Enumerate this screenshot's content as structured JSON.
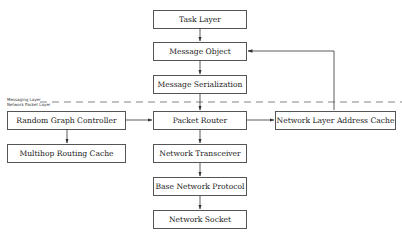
{
  "diagram": {
    "layers": {
      "upper_label": "Messaging Layer",
      "lower_label": "Network Packet Layer"
    },
    "nodes": [
      {
        "id": "task-layer",
        "label": "Task Layer"
      },
      {
        "id": "message-object",
        "label": "Message Object"
      },
      {
        "id": "message-serialization",
        "label": "Message Serialization"
      },
      {
        "id": "packet-router",
        "label": "Packet Router"
      },
      {
        "id": "network-transceiver",
        "label": "Network Transceiver"
      },
      {
        "id": "base-network-protocol",
        "label": "Base Network Protocol"
      },
      {
        "id": "network-socket",
        "label": "Network Socket"
      },
      {
        "id": "random-graph-controller",
        "label": "Random Graph Controller"
      },
      {
        "id": "multihop-routing-cache",
        "label": "Multihop Routing Cache"
      },
      {
        "id": "network-layer-address-cache",
        "label": "Network Layer Address Cache"
      }
    ],
    "edges": [
      {
        "from": "task-layer",
        "to": "message-object",
        "type": "bidirectional"
      },
      {
        "from": "message-object",
        "to": "message-serialization",
        "type": "bidirectional"
      },
      {
        "from": "message-serialization",
        "to": "packet-router",
        "type": "bidirectional"
      },
      {
        "from": "packet-router",
        "to": "network-transceiver",
        "type": "bidirectional"
      },
      {
        "from": "network-transceiver",
        "to": "base-network-protocol",
        "type": "bidirectional"
      },
      {
        "from": "base-network-protocol",
        "to": "network-socket",
        "type": "bidirectional"
      },
      {
        "from": "packet-router",
        "to": "random-graph-controller",
        "type": "bidirectional"
      },
      {
        "from": "random-graph-controller",
        "to": "multihop-routing-cache",
        "type": "bidirectional"
      },
      {
        "from": "packet-router",
        "to": "network-layer-address-cache",
        "type": "bidirectional"
      },
      {
        "from": "network-layer-address-cache",
        "to": "message-object",
        "type": "directed"
      }
    ]
  }
}
